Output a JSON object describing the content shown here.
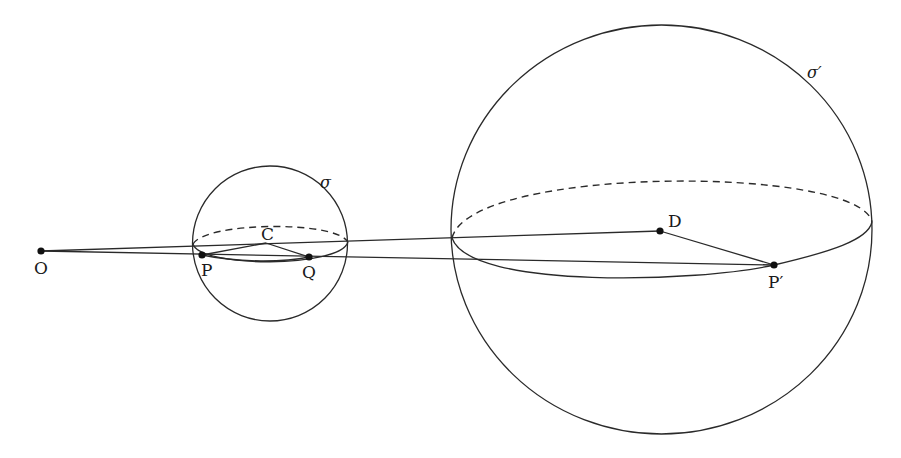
{
  "diagram": {
    "title": "",
    "stroke_color": "#2a2a2a",
    "background": "#ffffff",
    "points": {
      "O": {
        "label": "O",
        "x": 41,
        "y": 251
      },
      "P": {
        "label": "P",
        "x": 202,
        "y": 255
      },
      "C": {
        "label": "C",
        "x": 266,
        "y": 243
      },
      "Q": {
        "label": "Q",
        "x": 309,
        "y": 257
      },
      "D": {
        "label": "D",
        "x": 660,
        "y": 231
      },
      "P_prime": {
        "label": "P′",
        "x": 774,
        "y": 265
      }
    },
    "spheres": {
      "sigma": {
        "label": "σ",
        "cx": 270,
        "cy": 243,
        "r": 77
      },
      "sigma_prime": {
        "label": "σ′",
        "cx": 661,
        "cy": 229,
        "rx": 211,
        "ry": 205
      }
    },
    "segments": [
      {
        "from": "O",
        "to": "D",
        "description": "line from O tangent through sphere σ to center D"
      },
      {
        "from": "O",
        "to": "P_prime",
        "description": "line from O through P and Q to P′"
      },
      {
        "from": "P",
        "to": "C"
      },
      {
        "from": "C",
        "to": "Q"
      },
      {
        "from": "D",
        "to": "P_prime"
      }
    ]
  }
}
